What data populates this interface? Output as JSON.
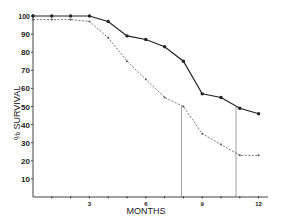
{
  "chart_data": {
    "type": "line",
    "title": "",
    "xlabel": "MONTHS",
    "ylabel": "% SURVIVAL",
    "xlim": [
      0,
      12.5
    ],
    "ylim": [
      0,
      100
    ],
    "x_ticks": [
      3,
      6,
      9,
      12
    ],
    "x_minor_ticks": [
      1,
      2,
      3,
      4,
      5,
      6,
      7,
      8,
      9,
      10,
      11,
      12
    ],
    "y_ticks": [
      10,
      20,
      30,
      40,
      50,
      60,
      70,
      80,
      90,
      100
    ],
    "grid": false,
    "legend": null,
    "x": [
      0,
      1,
      2,
      3,
      4,
      5,
      6,
      7,
      8,
      9,
      10,
      11,
      12
    ],
    "series": [
      {
        "name": "solid",
        "style": "solid-with-markers",
        "color": "#222222",
        "values": [
          100,
          100,
          100,
          100,
          97,
          89,
          87,
          83,
          75,
          57,
          55,
          49,
          46
        ]
      },
      {
        "name": "dashed",
        "style": "dashed-with-markers",
        "color": "#555555",
        "values": [
          98,
          98,
          98,
          97,
          88,
          75,
          65,
          55,
          50,
          35,
          29,
          23,
          23
        ]
      }
    ],
    "annotations": [
      {
        "type": "vline",
        "x": 7.9,
        "from_y": 0,
        "to_y": 50,
        "note": "median survival dashed"
      },
      {
        "type": "vline",
        "x": 10.8,
        "from_y": 0,
        "to_y": 50,
        "note": "median survival solid"
      }
    ]
  },
  "labels": {
    "y_title": "% SURVIVAL",
    "x_title": "MONTHS"
  }
}
